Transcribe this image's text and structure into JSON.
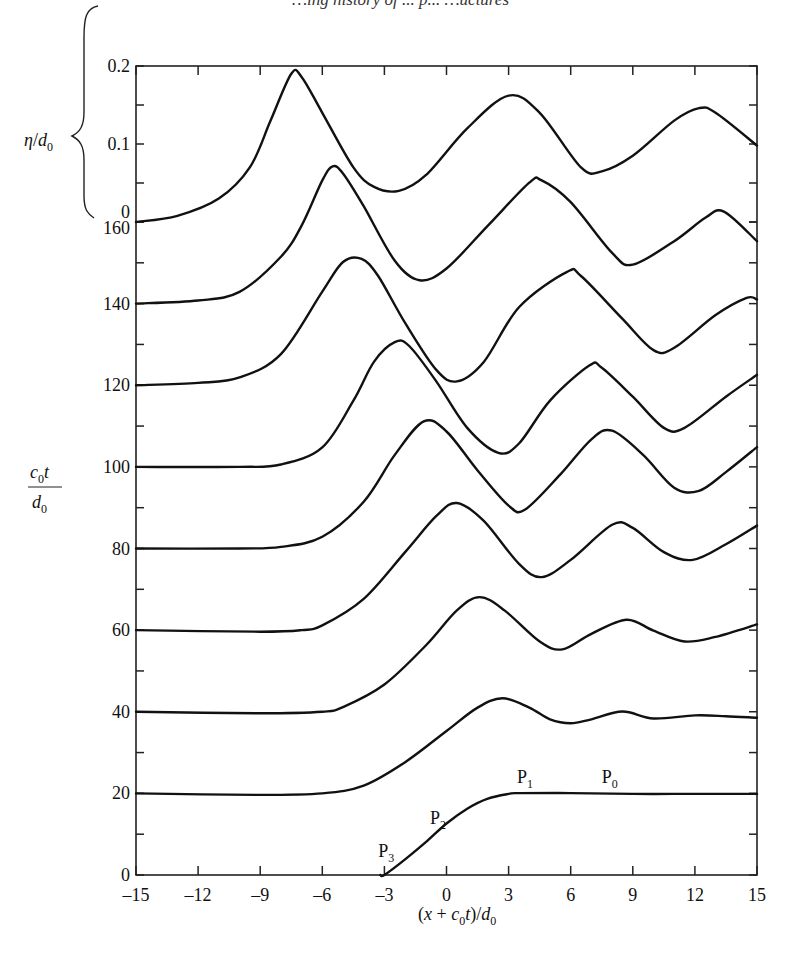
{
  "header": {
    "running_head": "…ing history of ... p... …uctures"
  },
  "chart_data": {
    "type": "line",
    "title": "",
    "xlabel": "(x + c0t)/d0",
    "ylabel": "c0t/d0",
    "secondary_ylabel": "η/d0",
    "xlim": [
      -15,
      15
    ],
    "ylim": [
      0,
      160
    ],
    "x_ticks": [
      -15,
      -12,
      -9,
      -6,
      -3,
      0,
      3,
      6,
      9,
      12,
      15
    ],
    "y_ticks": [
      0,
      20,
      40,
      60,
      80,
      100,
      120,
      140,
      160
    ],
    "y_minor_ticks": [
      10,
      30,
      50,
      70,
      90,
      110,
      130,
      150
    ],
    "eta_ticks": [
      0,
      0.1,
      0.2
    ],
    "eta_minor_ticks": [
      0.05,
      0.15
    ],
    "grid": false,
    "annotations": [
      {
        "label": "P",
        "sub": "3",
        "x": -3.3,
        "t": 4.5
      },
      {
        "label": "P",
        "sub": "2",
        "x": -0.8,
        "t": 12.5
      },
      {
        "label": "P",
        "sub": "1",
        "x": 3.4,
        "t": 22.5
      },
      {
        "label": "P",
        "sub": "0",
        "x": 7.5,
        "t": 22.5
      }
    ],
    "series": [
      {
        "name": "c0t/d0 = 0",
        "t": 0,
        "points": [
          [
            -15,
            0
          ],
          [
            -3.2,
            0
          ],
          [
            -3,
            0.0
          ],
          [
            -2,
            0.02
          ],
          [
            -1,
            0.042
          ],
          [
            0,
            0.066
          ],
          [
            1,
            0.085
          ],
          [
            2,
            0.098
          ],
          [
            3,
            0.104
          ],
          [
            3.5,
            0.105
          ],
          [
            6,
            0.105
          ],
          [
            9,
            0.104
          ],
          [
            12,
            0.104
          ],
          [
            15,
            0.104
          ]
        ]
      },
      {
        "name": "c0t/d0 = 20",
        "t": 20,
        "points": [
          [
            -15,
            0
          ],
          [
            -9,
            -0.002
          ],
          [
            -6,
            0.0
          ],
          [
            -4,
            0.01
          ],
          [
            -2,
            0.04
          ],
          [
            0,
            0.08
          ],
          [
            1.5,
            0.11
          ],
          [
            2.7,
            0.122
          ],
          [
            4,
            0.11
          ],
          [
            5,
            0.095
          ],
          [
            6,
            0.09
          ],
          [
            7,
            0.095
          ],
          [
            8.5,
            0.105
          ],
          [
            10,
            0.096
          ],
          [
            12,
            0.1
          ],
          [
            13.5,
            0.099
          ],
          [
            15,
            0.097
          ]
        ]
      },
      {
        "name": "c0t/d0 = 40",
        "t": 40,
        "points": [
          [
            -15,
            0
          ],
          [
            -9,
            -0.002
          ],
          [
            -6,
            0.0
          ],
          [
            -5,
            0.006
          ],
          [
            -3,
            0.035
          ],
          [
            -1,
            0.085
          ],
          [
            0.5,
            0.13
          ],
          [
            1.6,
            0.147
          ],
          [
            2.8,
            0.13
          ],
          [
            4.5,
            0.09
          ],
          [
            5.6,
            0.08
          ],
          [
            7,
            0.1
          ],
          [
            8.7,
            0.118
          ],
          [
            10,
            0.104
          ],
          [
            11.5,
            0.09
          ],
          [
            13,
            0.096
          ],
          [
            15,
            0.112
          ]
        ]
      },
      {
        "name": "c0t/d0 = 60",
        "t": 60,
        "points": [
          [
            -15,
            0
          ],
          [
            -9,
            -0.002
          ],
          [
            -7,
            0.0
          ],
          [
            -6,
            0.006
          ],
          [
            -4,
            0.04
          ],
          [
            -2,
            0.1
          ],
          [
            -0.5,
            0.146
          ],
          [
            0.5,
            0.163
          ],
          [
            1.8,
            0.14
          ],
          [
            3.5,
            0.085
          ],
          [
            4.6,
            0.068
          ],
          [
            6,
            0.09
          ],
          [
            8,
            0.135
          ],
          [
            9,
            0.131
          ],
          [
            10.5,
            0.1
          ],
          [
            11.9,
            0.09
          ],
          [
            13.5,
            0.11
          ],
          [
            15,
            0.134
          ]
        ]
      },
      {
        "name": "c0t/d0 = 80",
        "t": 80,
        "points": [
          [
            -15,
            0
          ],
          [
            -10,
            0.0
          ],
          [
            -8,
            0.002
          ],
          [
            -6,
            0.015
          ],
          [
            -4,
            0.06
          ],
          [
            -2.5,
            0.12
          ],
          [
            -1.1,
            0.163
          ],
          [
            0,
            0.15
          ],
          [
            1.5,
            0.1
          ],
          [
            3,
            0.055
          ],
          [
            3.8,
            0.05
          ],
          [
            5.5,
            0.095
          ],
          [
            7,
            0.14
          ],
          [
            8,
            0.151
          ],
          [
            9.5,
            0.12
          ],
          [
            11,
            0.078
          ],
          [
            12.2,
            0.074
          ],
          [
            13.5,
            0.098
          ],
          [
            15,
            0.13
          ]
        ]
      },
      {
        "name": "c0t/d0 = 100",
        "t": 100,
        "points": [
          [
            -15,
            0
          ],
          [
            -10,
            0.0
          ],
          [
            -8,
            0.003
          ],
          [
            -6,
            0.025
          ],
          [
            -4.5,
            0.085
          ],
          [
            -3.5,
            0.135
          ],
          [
            -2.5,
            0.16
          ],
          [
            -1.8,
            0.155
          ],
          [
            -0.5,
            0.11
          ],
          [
            1,
            0.05
          ],
          [
            2.5,
            0.018
          ],
          [
            3.5,
            0.03
          ],
          [
            5,
            0.085
          ],
          [
            6.9,
            0.13
          ],
          [
            7.5,
            0.127
          ],
          [
            9,
            0.09
          ],
          [
            10.5,
            0.05
          ],
          [
            11.5,
            0.05
          ],
          [
            13.5,
            0.09
          ],
          [
            15,
            0.118
          ]
        ]
      },
      {
        "name": "c0t/d0 = 120",
        "t": 120,
        "points": [
          [
            -15,
            0
          ],
          [
            -12,
            0.003
          ],
          [
            -10,
            0.01
          ],
          [
            -8,
            0.04
          ],
          [
            -6,
            0.12
          ],
          [
            -5,
            0.158
          ],
          [
            -4.1,
            0.162
          ],
          [
            -3.3,
            0.14
          ],
          [
            -2,
            0.08
          ],
          [
            -0.5,
            0.02
          ],
          [
            0.5,
            0.005
          ],
          [
            1.8,
            0.03
          ],
          [
            3.5,
            0.1
          ],
          [
            5.8,
            0.145
          ],
          [
            6.5,
            0.14
          ],
          [
            8.5,
            0.085
          ],
          [
            10,
            0.045
          ],
          [
            11,
            0.048
          ],
          [
            13,
            0.09
          ],
          [
            14.5,
            0.112
          ],
          [
            15,
            0.11
          ]
        ]
      },
      {
        "name": "c0t/d0 = 140",
        "t": 140,
        "points": [
          [
            -15,
            0
          ],
          [
            -12,
            0.004
          ],
          [
            -10,
            0.015
          ],
          [
            -8,
            0.06
          ],
          [
            -7,
            0.1
          ],
          [
            -6,
            0.158
          ],
          [
            -5.5,
            0.176
          ],
          [
            -5,
            0.167
          ],
          [
            -4,
            0.125
          ],
          [
            -2.5,
            0.055
          ],
          [
            -1.3,
            0.03
          ],
          [
            0,
            0.045
          ],
          [
            2,
            0.1
          ],
          [
            4,
            0.155
          ],
          [
            4.6,
            0.158
          ],
          [
            6,
            0.13
          ],
          [
            8,
            0.065
          ],
          [
            9,
            0.05
          ],
          [
            11,
            0.08
          ],
          [
            12.5,
            0.11
          ],
          [
            13.4,
            0.118
          ],
          [
            15,
            0.08
          ]
        ]
      },
      {
        "name": "c0t/d0 = 160",
        "t": 160,
        "points": [
          [
            -15,
            0
          ],
          [
            -13,
            0.008
          ],
          [
            -11,
            0.03
          ],
          [
            -9.5,
            0.07
          ],
          [
            -8.5,
            0.13
          ],
          [
            -7.5,
            0.19
          ],
          [
            -7,
            0.186
          ],
          [
            -6,
            0.14
          ],
          [
            -4.5,
            0.07
          ],
          [
            -3.5,
            0.045
          ],
          [
            -2.3,
            0.04
          ],
          [
            -1,
            0.06
          ],
          [
            1,
            0.12
          ],
          [
            3,
            0.162
          ],
          [
            4.5,
            0.14
          ],
          [
            6.5,
            0.07
          ],
          [
            7.5,
            0.065
          ],
          [
            9,
            0.085
          ],
          [
            11,
            0.13
          ],
          [
            12.2,
            0.146
          ],
          [
            13,
            0.14
          ],
          [
            15,
            0.098
          ]
        ]
      }
    ]
  },
  "axes": {
    "x_title_parts": {
      "open": "(",
      "x": "x",
      "plus": " + ",
      "c": "c",
      "c_sub": "0",
      "t": "t",
      "close": ")/",
      "d": "d",
      "d_sub": "0"
    },
    "y_title_parts": {
      "num_c": "c",
      "num_c_sub": "0",
      "num_t": "t",
      "den_d": "d",
      "den_d_sub": "0"
    },
    "eta_title_parts": {
      "eta": "η",
      "slash": "/",
      "d": "d",
      "d_sub": "0"
    },
    "x_tick_labels": [
      "–15",
      "–12",
      "–9",
      "–6",
      "–3",
      "0",
      "3",
      "6",
      "9",
      "12",
      "15"
    ],
    "y_tick_labels": [
      "0",
      "20",
      "40",
      "60",
      "80",
      "100",
      "120",
      "140",
      "160"
    ],
    "eta_tick_labels": [
      "0",
      "0.1",
      "0.2"
    ]
  }
}
